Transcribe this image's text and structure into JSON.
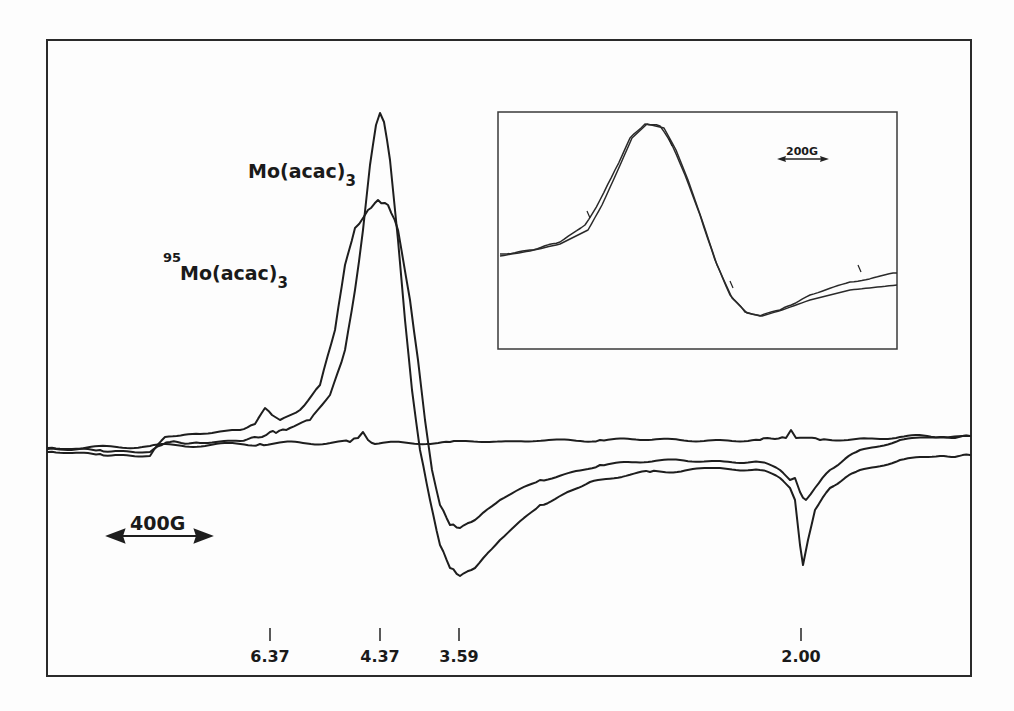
{
  "chart_data": {
    "type": "line",
    "title": "",
    "xlabel": "g-value (magnetic field)",
    "ylabel": "dχ''/dH (EPR derivative signal)",
    "grid": false,
    "legend": "inline labels",
    "scale_bar": {
      "label": "400G",
      "direction": "double-arrow"
    },
    "x_tick_labels": [
      "6.37",
      "4.37",
      "3.59",
      "2.00"
    ],
    "x_ticks_px": [
      270,
      380,
      459,
      801
    ],
    "annotations": [
      {
        "text": "Mo(acac)",
        "subscript": "3",
        "x": 248,
        "y": 178
      },
      {
        "superscript": "95",
        "text": "Mo(acac)",
        "subscript": "3",
        "x": 163,
        "y": 280
      }
    ],
    "series": [
      {
        "name": "Mo(acac)3",
        "description": "sharper derivative peak; max near g=4.37, min near g=3.59, sharp feature at g=2.00",
        "points": [
          [
            48,
            448
          ],
          [
            100,
            450
          ],
          [
            150,
            452
          ],
          [
            162,
            445
          ],
          [
            170,
            442
          ],
          [
            200,
            443
          ],
          [
            240,
            441
          ],
          [
            262,
            437
          ],
          [
            270,
            432
          ],
          [
            276,
            433
          ],
          [
            290,
            428
          ],
          [
            310,
            420
          ],
          [
            330,
            395
          ],
          [
            345,
            350
          ],
          [
            355,
            290
          ],
          [
            363,
            230
          ],
          [
            370,
            165
          ],
          [
            376,
            125
          ],
          [
            380,
            113
          ],
          [
            384,
            122
          ],
          [
            390,
            160
          ],
          [
            398,
            240
          ],
          [
            405,
            320
          ],
          [
            412,
            390
          ],
          [
            420,
            450
          ],
          [
            430,
            500
          ],
          [
            440,
            545
          ],
          [
            450,
            568
          ],
          [
            460,
            576
          ],
          [
            475,
            568
          ],
          [
            500,
            540
          ],
          [
            540,
            505
          ],
          [
            590,
            482
          ],
          [
            650,
            472
          ],
          [
            720,
            468
          ],
          [
            760,
            470
          ],
          [
            780,
            478
          ],
          [
            790,
            488
          ],
          [
            795,
            500
          ],
          [
            800,
            545
          ],
          [
            803,
            565
          ],
          [
            808,
            540
          ],
          [
            815,
            510
          ],
          [
            830,
            488
          ],
          [
            860,
            470
          ],
          [
            900,
            460
          ],
          [
            940,
            456
          ],
          [
            970,
            455
          ]
        ]
      },
      {
        "name": "95Mo(acac)3",
        "description": "broader derivative peak; max near g=4.37, shallower min near g=3.59, hyperfine features at g=2.00",
        "points": [
          [
            48,
            452
          ],
          [
            100,
            454
          ],
          [
            150,
            456
          ],
          [
            165,
            437
          ],
          [
            200,
            434
          ],
          [
            240,
            430
          ],
          [
            255,
            424
          ],
          [
            265,
            408
          ],
          [
            272,
            415
          ],
          [
            280,
            420
          ],
          [
            300,
            410
          ],
          [
            320,
            385
          ],
          [
            335,
            330
          ],
          [
            345,
            265
          ],
          [
            355,
            228
          ],
          [
            368,
            210
          ],
          [
            378,
            200
          ],
          [
            388,
            205
          ],
          [
            398,
            230
          ],
          [
            410,
            300
          ],
          [
            418,
            360
          ],
          [
            425,
            420
          ],
          [
            432,
            470
          ],
          [
            440,
            505
          ],
          [
            450,
            525
          ],
          [
            460,
            528
          ],
          [
            475,
            520
          ],
          [
            500,
            500
          ],
          [
            540,
            480
          ],
          [
            600,
            465
          ],
          [
            680,
            460
          ],
          [
            760,
            462
          ],
          [
            780,
            470
          ],
          [
            790,
            480
          ],
          [
            795,
            478
          ],
          [
            800,
            492
          ],
          [
            806,
            500
          ],
          [
            815,
            488
          ],
          [
            830,
            470
          ],
          [
            860,
            450
          ],
          [
            900,
            440
          ],
          [
            940,
            437
          ],
          [
            970,
            436
          ]
        ]
      },
      {
        "name": "baseline",
        "description": "flat background trace with small features at g=4.37 and g=2.00",
        "points": [
          [
            48,
            449
          ],
          [
            150,
            446
          ],
          [
            260,
            444
          ],
          [
            350,
            442
          ],
          [
            358,
            438
          ],
          [
            363,
            432
          ],
          [
            368,
            440
          ],
          [
            375,
            444
          ],
          [
            450,
            442
          ],
          [
            600,
            440
          ],
          [
            760,
            440
          ],
          [
            786,
            438
          ],
          [
            791,
            430
          ],
          [
            796,
            438
          ],
          [
            820,
            440
          ],
          [
            900,
            437
          ],
          [
            970,
            436
          ]
        ]
      }
    ],
    "inset": {
      "type": "line",
      "scale_bar": {
        "label": "200G",
        "direction": "double-arrow"
      },
      "series": [
        {
          "name": "experimental",
          "points": [
            [
              500,
              254
            ],
            [
              530,
              250
            ],
            [
              560,
              242
            ],
            [
              585,
              225
            ],
            [
              600,
              200
            ],
            [
              615,
              170
            ],
            [
              630,
              138
            ],
            [
              645,
              124
            ],
            [
              660,
              126
            ],
            [
              672,
              145
            ],
            [
              685,
              175
            ],
            [
              700,
              215
            ],
            [
              715,
              260
            ],
            [
              730,
              295
            ],
            [
              745,
              312
            ],
            [
              760,
              316
            ],
            [
              780,
              310
            ],
            [
              810,
              295
            ],
            [
              850,
              282
            ],
            [
              897,
              273
            ]
          ]
        },
        {
          "name": "simulated",
          "points": [
            [
              500,
              256
            ],
            [
              530,
              251
            ],
            [
              560,
              244
            ],
            [
              588,
              230
            ],
            [
              602,
              205
            ],
            [
              617,
              172
            ],
            [
              632,
              138
            ],
            [
              647,
              124
            ],
            [
              664,
              128
            ],
            [
              676,
              150
            ],
            [
              688,
              180
            ],
            [
              702,
              220
            ],
            [
              717,
              265
            ],
            [
              732,
              298
            ],
            [
              747,
              313
            ],
            [
              762,
              316
            ],
            [
              782,
              310
            ],
            [
              810,
              300
            ],
            [
              850,
              290
            ],
            [
              897,
              285
            ]
          ]
        }
      ],
      "arrow_markers": [
        {
          "x": 590,
          "y": 218
        },
        {
          "x": 672,
          "y": 146
        },
        {
          "x": 733,
          "y": 288
        },
        {
          "x": 861,
          "y": 272
        }
      ]
    }
  },
  "labels": {
    "series1_main": "Mo(acac)",
    "series1_sub": "3",
    "series2_sup": "95",
    "series2_main": "Mo(acac)",
    "series2_sub": "3",
    "scale_main": "400G",
    "scale_inset": "200G",
    "ticks": [
      "6.37",
      "4.37",
      "3.59",
      "2.00"
    ]
  }
}
